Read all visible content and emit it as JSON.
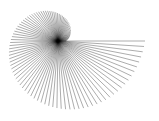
{
  "figure": {
    "background": "#ffffff",
    "line_color": "#000000",
    "line_opacity": 0.55,
    "line_width": 0.6,
    "center": [
      58,
      41
    ],
    "spiral": {
      "type": "archimedean",
      "r_start": 87,
      "r_end": 8,
      "theta_start_deg": 0,
      "theta_end_deg": 360,
      "direction": "clockwise",
      "num_lines": 100
    }
  }
}
